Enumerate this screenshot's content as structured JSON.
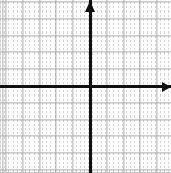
{
  "figure": {
    "description": "Blank Cartesian coordinate plane with dotted minor gridlines, darker major gridlines, and bold x- and y-axes meeting at the origin. Arrowheads mark the positive x direction (right) and positive y direction (up). No numeric tick labels are printed.",
    "width_px": 171,
    "height_px": 173,
    "background_color": "#fdfdfd"
  },
  "chart_data": {
    "type": "scatter",
    "title": "",
    "subtitle": "",
    "xlabel": "",
    "ylabel": "",
    "series": [],
    "annotations": [],
    "tick_labels": {
      "x": [],
      "y": []
    },
    "grid": {
      "enabled": true,
      "minor_spacing_px": 4.2,
      "major_spacing_px": 16.8,
      "minor_style": "dotted",
      "major_style": "solid",
      "minor_color": "#9a9a9a",
      "major_color": "#6d6d6d"
    },
    "legend": {
      "visible": false,
      "position": "none"
    },
    "axes": {
      "origin_px": {
        "x": 90,
        "y": 86
      },
      "color": "#101010",
      "line_width_px": 3,
      "x_axis_arrow": "right",
      "y_axis_arrow": "up",
      "x_axis_extends_left_to_edge": true,
      "y_axis_extends_down_to_edge": true
    }
  },
  "axes": {
    "x_label": "x-axis",
    "y_label": "y-axis",
    "origin_label": "origin",
    "x_arrow_label": "positive x direction",
    "y_arrow_label": "positive y direction"
  },
  "colors": {
    "axis": "#101010",
    "major_grid": "#6d6d6d",
    "minor_grid": "#9a9a9a",
    "frame": "#c8c8c8",
    "background": "#fdfdfd"
  }
}
